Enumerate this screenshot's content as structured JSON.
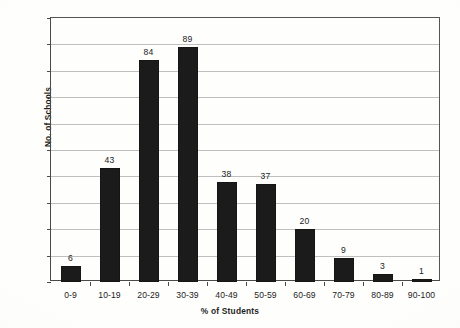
{
  "chart_data": {
    "type": "bar",
    "title": "",
    "subtitle": "",
    "xlabel": "% of Students",
    "ylabel": "No. of Schools",
    "categories": [
      "0-9",
      "10-19",
      "20-29",
      "30-39",
      "40-49",
      "50-59",
      "60-69",
      "70-79",
      "80-89",
      "90-100"
    ],
    "values": [
      6,
      43,
      84,
      89,
      38,
      37,
      20,
      9,
      3,
      1
    ],
    "data_labels": [
      "6",
      "43",
      "84",
      "89",
      "38",
      "37",
      "20",
      "9",
      "3",
      "1"
    ],
    "ylim": [
      0,
      100
    ],
    "ytick_step": 10,
    "yticks": [
      "0",
      "10",
      "20",
      "30",
      "40",
      "50",
      "60",
      "70",
      "80",
      "90",
      "100"
    ],
    "grid": "horizontal",
    "legend": "none",
    "bar_color": "#1b1b1b",
    "gridline_color": "#bfbfbf",
    "axis_color": "#4a4a4a",
    "background_color": "#fefefc",
    "annotations": []
  }
}
